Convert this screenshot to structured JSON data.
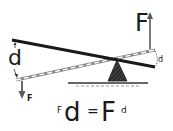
{
  "diagram": {
    "type": "lever",
    "labels": {
      "effort_force": "F",
      "load_force": "F",
      "left_distance": "d",
      "right_distance": "d"
    },
    "equation": {
      "left_small": "F",
      "left_big": "d",
      "equals": "=",
      "right_big": "F",
      "right_small": "d"
    },
    "colors": {
      "ink": "#1a1a1a",
      "arrow": "#5a5a5a",
      "dashed": "#9a9a9a",
      "background": "#ffffff"
    }
  }
}
